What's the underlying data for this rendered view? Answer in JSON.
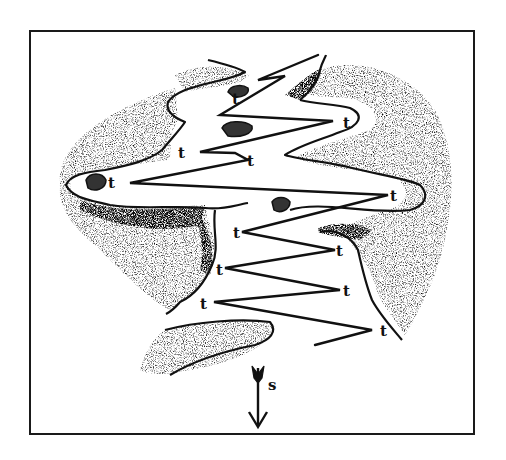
{
  "figure": {
    "type": "schematic illustration",
    "colors": {
      "ink": "#111111",
      "background": "#ffffff",
      "stipple": "#555555"
    },
    "turn_label": "t",
    "turn_points": [
      {
        "x": 235,
        "y": 98
      },
      {
        "x": 345,
        "y": 122
      },
      {
        "x": 183,
        "y": 152
      },
      {
        "x": 248,
        "y": 160
      },
      {
        "x": 112,
        "y": 183
      },
      {
        "x": 392,
        "y": 195
      },
      {
        "x": 242,
        "y": 232
      },
      {
        "x": 338,
        "y": 250
      },
      {
        "x": 224,
        "y": 268
      },
      {
        "x": 345,
        "y": 290
      },
      {
        "x": 205,
        "y": 302
      },
      {
        "x": 382,
        "y": 330
      }
    ],
    "arrow": {
      "label": "s",
      "direction": "down",
      "x": 258,
      "y_start": 368,
      "y_end": 428
    }
  }
}
